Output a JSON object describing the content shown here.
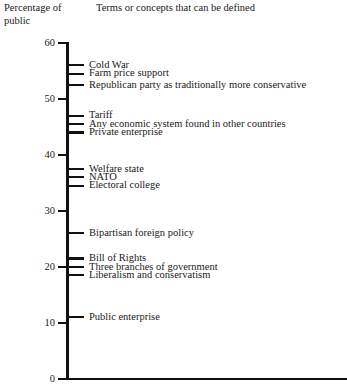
{
  "header": {
    "y_axis_caption": "Percentage of\npublic",
    "column_caption": "Terms or concepts that can be defined"
  },
  "axis": {
    "ticks": [
      {
        "value": 60,
        "label": "60"
      },
      {
        "value": 50,
        "label": "50"
      },
      {
        "value": 40,
        "label": "40"
      },
      {
        "value": 30,
        "label": "30"
      },
      {
        "value": 20,
        "label": "20"
      },
      {
        "value": 10,
        "label": "10"
      },
      {
        "value": 0,
        "label": "0"
      }
    ]
  },
  "chart_data": {
    "type": "scatter",
    "title": "",
    "subtitle": "",
    "xlabel": "Terms or concepts that can be defined",
    "ylabel": "Percentage of public",
    "ylim": [
      0,
      60
    ],
    "xlim": [
      0,
      1
    ],
    "grid": false,
    "legend": null,
    "orientation": "vertical-number-line",
    "categories": [
      "Cold War",
      "Farm price support",
      "Republican party as traditionally more conservative",
      "Tariff",
      "Any economic system found in other countries",
      "Private enterprise",
      "Welfare state",
      "NATO",
      "Electoral college",
      "Bipartisan foreign policy",
      "Bill of Rights",
      "Three branches of government",
      "Liberalism and conservatism",
      "Public enterprise"
    ],
    "values": [
      56,
      54.5,
      52.5,
      47,
      45.5,
      44,
      37.5,
      36,
      34.5,
      26,
      21.5,
      20,
      18.5,
      11
    ],
    "points": [
      {
        "label": "Cold War",
        "value": 56
      },
      {
        "label": "Farm price support",
        "value": 54.5
      },
      {
        "label": "Republican party as traditionally more conservative",
        "value": 52.5
      },
      {
        "label": "Tariff",
        "value": 47
      },
      {
        "label": "Any economic system found in other countries",
        "value": 45.5
      },
      {
        "label": "Private enterprise",
        "value": 44
      },
      {
        "label": "Welfare state",
        "value": 37.5
      },
      {
        "label": "NATO",
        "value": 36
      },
      {
        "label": "Electoral college",
        "value": 34.5
      },
      {
        "label": "Bipartisan foreign policy",
        "value": 26
      },
      {
        "label": "Bill of Rights",
        "value": 21.5
      },
      {
        "label": "Three branches of government",
        "value": 20
      },
      {
        "label": "Liberalism and conservatism",
        "value": 18.5
      },
      {
        "label": "Public enterprise",
        "value": 11
      }
    ]
  },
  "colors": {
    "ink": "#111111",
    "background": "#ffffff"
  }
}
